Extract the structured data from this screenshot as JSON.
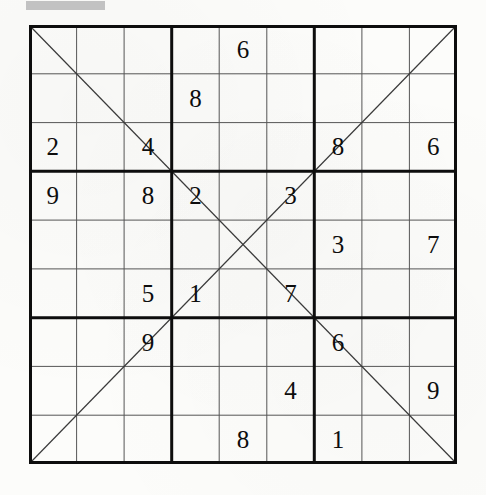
{
  "page": {
    "background_color": "#fcfcfa",
    "ink_color": "#0d0d0d",
    "redaction_color": "#b9b9b9"
  },
  "puzzle": {
    "type": "diagonal-sudoku",
    "rows": 9,
    "columns": 9,
    "box_rows": 3,
    "box_columns": 3,
    "diagonals_drawn": [
      "main-diagonal-top-left-to-bottom-right",
      "anti-diagonal-bottom-left-to-top-right"
    ],
    "grid": [
      [
        null,
        null,
        null,
        null,
        "6",
        null,
        null,
        null,
        null
      ],
      [
        null,
        null,
        null,
        "8",
        null,
        null,
        null,
        null,
        null
      ],
      [
        "2",
        null,
        "4",
        null,
        null,
        null,
        "8",
        null,
        "6"
      ],
      [
        "9",
        null,
        "8",
        "2",
        null,
        "3",
        null,
        null,
        null
      ],
      [
        null,
        null,
        null,
        null,
        null,
        null,
        "3",
        null,
        "7"
      ],
      [
        null,
        null,
        "5",
        "1",
        null,
        "7",
        null,
        null,
        null
      ],
      [
        null,
        null,
        "9",
        null,
        null,
        null,
        "6",
        null,
        null
      ],
      [
        null,
        null,
        null,
        null,
        null,
        "4",
        null,
        null,
        "9"
      ],
      [
        null,
        null,
        null,
        null,
        "8",
        null,
        "1",
        null,
        null
      ]
    ],
    "clue_count": 21
  }
}
